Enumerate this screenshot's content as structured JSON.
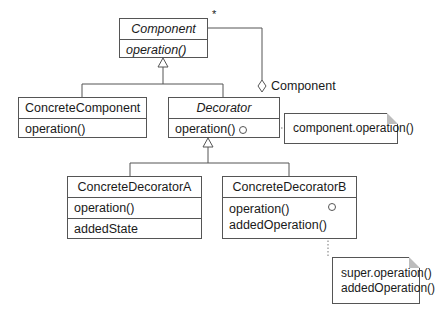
{
  "diagram": {
    "type": "UML class diagram",
    "classes": {
      "component": {
        "name": "Component",
        "abstract": true,
        "operations": [
          "operation()"
        ]
      },
      "concrete_component": {
        "name": "ConcreteComponent",
        "operations": [
          "operation()"
        ]
      },
      "decorator": {
        "name": "Decorator",
        "abstract": true,
        "operations": [
          "operation()"
        ]
      },
      "concrete_decorator_a": {
        "name": "ConcreteDecoratorA",
        "operations": [
          "operation()"
        ],
        "attributes": [
          "addedState"
        ]
      },
      "concrete_decorator_b": {
        "name": "ConcreteDecoratorB",
        "operations": [
          "operation()",
          "addedOperation()"
        ]
      }
    },
    "notes": {
      "decorator_note": {
        "lines": [
          "component.operation()"
        ]
      },
      "decorator_b_note": {
        "lines": [
          "super.operation()",
          "addedOperation()"
        ]
      }
    },
    "associations": {
      "aggregation_role": "Component",
      "multiplicity": "*"
    },
    "colors": {
      "line": "#555555",
      "note_fold": "#bdbdbd",
      "background": "#ffffff"
    }
  }
}
